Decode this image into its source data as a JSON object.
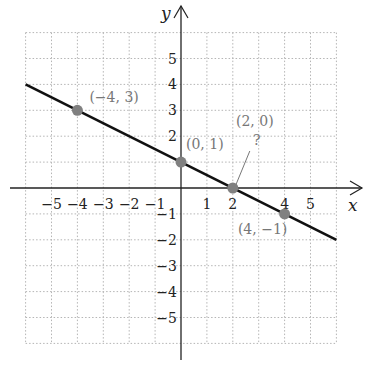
{
  "chart_data": {
    "type": "line",
    "title": "",
    "xlabel": "x",
    "ylabel": "y",
    "xlim": [
      -6,
      6
    ],
    "ylim": [
      -6,
      6
    ],
    "grid": true,
    "x_ticks": [
      "−5",
      "−4",
      "−3",
      "−2",
      "−1",
      "1",
      "2",
      "4",
      "5"
    ],
    "y_ticks": [
      "5",
      "4",
      "3",
      "2",
      "−1",
      "−2",
      "−3",
      "−4",
      "−5"
    ],
    "series": [
      {
        "name": "line",
        "x": [
          -6,
          6
        ],
        "y": [
          4,
          -2
        ]
      }
    ],
    "points": [
      {
        "x": -4,
        "y": 3,
        "label": "(−4, 3)"
      },
      {
        "x": 0,
        "y": 1,
        "label": "(0, 1)"
      },
      {
        "x": 2,
        "y": 0,
        "label": "(2, 0)",
        "note": "?"
      },
      {
        "x": 4,
        "y": -1,
        "label": "(4, −1)"
      }
    ],
    "colors": {
      "line": "#111111",
      "point": "#808080",
      "grid": "#b0b0b0"
    }
  }
}
